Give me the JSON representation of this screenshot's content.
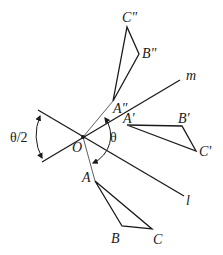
{
  "diagram": {
    "colors": {
      "ink": "#1a1a1a",
      "background": "#ffffff"
    },
    "lines": {
      "m": {
        "label": "m"
      },
      "l": {
        "label": "l"
      }
    },
    "origin": {
      "label": "O"
    },
    "angles": {
      "half": {
        "label": "θ/2"
      },
      "full": {
        "label": "θ"
      }
    },
    "triangles": {
      "original": {
        "a": "A",
        "b": "B",
        "c": "C"
      },
      "first_reflection": {
        "a": "A'",
        "b": "B'",
        "c": "C'"
      },
      "second_reflection": {
        "a": "A\"",
        "b": "B\"",
        "c": "C\""
      }
    }
  }
}
